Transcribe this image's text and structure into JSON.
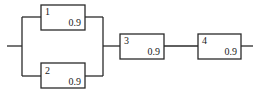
{
  "diagram": {
    "type": "reliability-block-diagram",
    "components": [
      {
        "id": "1",
        "label": "1",
        "reliability": "0.9",
        "position": "parallel-top"
      },
      {
        "id": "2",
        "label": "2",
        "reliability": "0.9",
        "position": "parallel-bottom"
      },
      {
        "id": "3",
        "label": "3",
        "reliability": "0.9",
        "position": "series"
      },
      {
        "id": "4",
        "label": "4",
        "reliability": "0.9",
        "position": "series"
      }
    ],
    "connections": [
      {
        "from": "input",
        "to": "1"
      },
      {
        "from": "input",
        "to": "2"
      },
      {
        "from": "1",
        "to": "3"
      },
      {
        "from": "2",
        "to": "3"
      },
      {
        "from": "3",
        "to": "4"
      },
      {
        "from": "4",
        "to": "output"
      }
    ],
    "colors": {
      "line": "#2a2a2a",
      "background": "#ffffff"
    }
  }
}
